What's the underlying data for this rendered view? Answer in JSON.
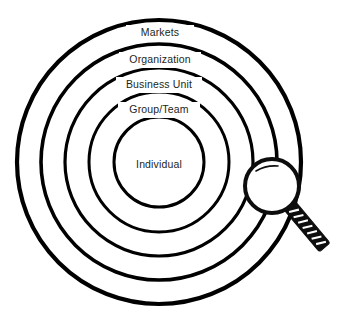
{
  "diagram": {
    "background_color": "#ffffff",
    "stroke_color": "#000000",
    "text_color": "#231f20",
    "width": 351,
    "height": 320,
    "center": {
      "x": 159,
      "y": 162
    },
    "rings": [
      {
        "index": 0,
        "label": "Markets",
        "radius": 142,
        "stroke_width": 4.2,
        "label_x": 160,
        "label_y": 33
      },
      {
        "index": 1,
        "label": "Organization",
        "radius": 118,
        "stroke_width": 3.6,
        "label_x": 160,
        "label_y": 60
      },
      {
        "index": 2,
        "label": "Business Unit",
        "radius": 94,
        "stroke_width": 3.2,
        "label_x": 159,
        "label_y": 85
      },
      {
        "index": 3,
        "label": "Group/Team",
        "radius": 70,
        "stroke_width": 3.0,
        "label_x": 159,
        "label_y": 110
      },
      {
        "index": 4,
        "label": "Individual",
        "radius": 45,
        "stroke_width": 3.0,
        "label_x": 159,
        "label_y": 165
      }
    ],
    "magnifier": {
      "name": "magnifying-glass",
      "lens": {
        "cx": 272,
        "cy": 186,
        "r": 27,
        "stroke_width": 4.0,
        "fill": "#ffffff",
        "stroke": "#0d0d0d"
      },
      "glint": {
        "description": "small highlight arc at upper-left of lens"
      },
      "handle": {
        "x1": 290,
        "y1": 206,
        "x2": 326,
        "y2": 249,
        "width": 14,
        "fill": "#0d0d0d",
        "hatch_count": 7,
        "hatch_color": "#ffffff"
      }
    }
  }
}
